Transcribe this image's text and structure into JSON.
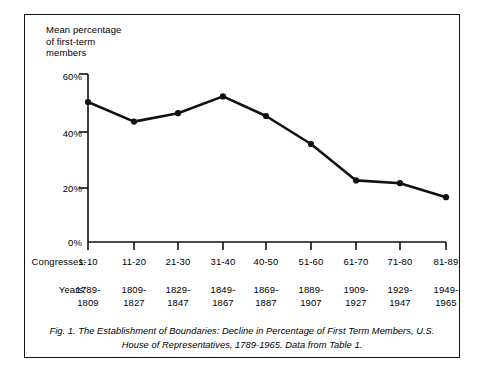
{
  "figure": {
    "axis_title": "Mean percentage\nof first-term\nmembers",
    "caption": "Fig. 1. The Establishment of Boundaries: Decline in Percentage of First Term Members, U.S. House of Representatives, 1789-1965. Data from Table 1.",
    "row_label_congresses": "Congresses:",
    "row_label_years": "Years:",
    "line_color": "#111111",
    "axis_color": "#111111",
    "border_color": "#111111",
    "background": "#ffffff"
  },
  "chart_data": {
    "type": "line",
    "title": "Fig. 1. The Establishment of Boundaries: Decline in Percentage of First Term Members, U.S. House of Representatives, 1789-1965. Data from Table 1.",
    "xlabel": "Congresses",
    "ylabel": "Mean percentage of first-term members",
    "ylim": [
      0,
      60
    ],
    "yticks": [
      0,
      20,
      40,
      60
    ],
    "ytick_labels": [
      "0%",
      "20%",
      "40%",
      "60%"
    ],
    "grid": false,
    "legend": "none",
    "categories": [
      "1-10",
      "11-20",
      "21-30",
      "31-40",
      "40-50",
      "51-60",
      "61-70",
      "71-80",
      "81-89"
    ],
    "x_sublabels": [
      "1789-\n1809",
      "1809-\n1827",
      "1829-\n1847",
      "1849-\n1867",
      "1869-\n1887",
      "1889-\n1907",
      "1909-\n1927",
      "1929-\n1947",
      "1949-\n1965"
    ],
    "values": [
      50,
      43,
      46,
      52,
      45,
      35,
      22,
      21,
      16
    ],
    "markers": "filled-circle"
  }
}
